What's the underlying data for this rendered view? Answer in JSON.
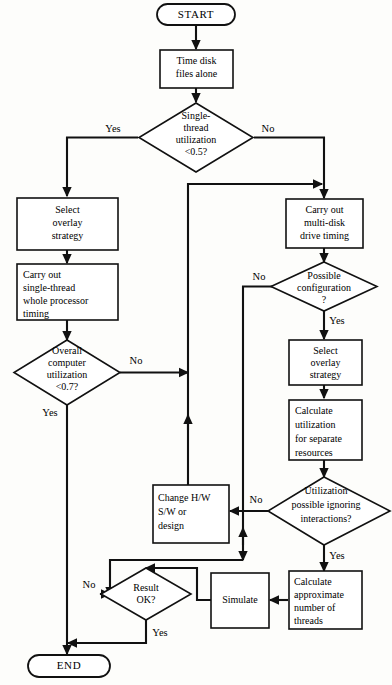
{
  "diagram": {
    "type": "flowchart",
    "colors": {
      "stroke": "#111111",
      "fill": "#ffffff",
      "background": "#fdfdfb"
    }
  },
  "nodes": {
    "start": {
      "label": "START",
      "shape": "terminator"
    },
    "time_disk": {
      "line1": "Time disk",
      "line2": "files alone",
      "shape": "process"
    },
    "single_thread_util": {
      "line1": "Single-",
      "line2": "thread",
      "line3": "utilization",
      "line4": "<0.5?",
      "shape": "decision"
    },
    "select_overlay_left": {
      "line1": "Select",
      "line2": "overlay",
      "line3": "strategy",
      "shape": "process"
    },
    "carry_out_single": {
      "line1": "Carry out",
      "line2": "single-thread",
      "line3": "whole processor",
      "line4": "timing",
      "shape": "process"
    },
    "overall_util": {
      "line1": "Overall",
      "line2": "computer",
      "line3": "utilization",
      "line4": "<0.7?",
      "shape": "decision"
    },
    "carry_out_multi": {
      "line1": "Carry out",
      "line2": "multi-disk",
      "line3": "drive timing",
      "shape": "process"
    },
    "possible_config": {
      "line1": "Possible",
      "line2": "configuration",
      "line3": "?",
      "shape": "decision"
    },
    "select_overlay_right": {
      "line1": "Select",
      "line2": "overlay",
      "line3": "strategy",
      "shape": "process"
    },
    "calculate_util": {
      "line1": "Calculate",
      "line2": "utilization",
      "line3": "for separate",
      "line4": "resources",
      "shape": "process"
    },
    "util_possible": {
      "line1": "Utilization",
      "line2": "possible ignoring",
      "line3": "interactions?",
      "shape": "decision"
    },
    "change_hw": {
      "line1": "Change H/W",
      "line2": "S/W or",
      "line3": "design",
      "shape": "process"
    },
    "calculate_threads": {
      "line1": "Calculate",
      "line2": "approximate",
      "line3": "number of",
      "line4": "threads",
      "shape": "process"
    },
    "simulate": {
      "label": "Simulate",
      "shape": "process"
    },
    "result_ok": {
      "line1": "Result",
      "line2": "OK?",
      "shape": "decision"
    },
    "end": {
      "label": "END",
      "shape": "terminator"
    }
  },
  "edge_labels": {
    "single_thread_yes": "Yes",
    "single_thread_no": "No",
    "overall_util_no": "No",
    "overall_util_yes": "Yes",
    "possible_config_no": "No",
    "possible_config_yes": "Yes",
    "util_possible_no": "No",
    "util_possible_yes": "Yes",
    "result_ok_no": "No",
    "result_ok_yes": "Yes"
  }
}
